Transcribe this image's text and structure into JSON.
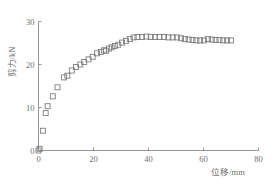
{
  "chart_data": {
    "type": "scatter",
    "title": "",
    "subtitle": "",
    "xlabel": "位移/mm",
    "ylabel": "剪力/kN",
    "xlim": [
      0,
      80
    ],
    "ylim": [
      0,
      30
    ],
    "xticks": [
      0,
      20,
      40,
      60,
      80
    ],
    "yticks": [
      0,
      10,
      20,
      30
    ],
    "xticklabels": [
      "0",
      "20",
      "40",
      "60",
      "80"
    ],
    "yticklabels": [
      "0",
      "10",
      "20",
      "30"
    ],
    "grid": false,
    "legend": null,
    "marker": "open-square",
    "marker_color": "#787878",
    "series": [
      {
        "name": "剪力-位移曲线",
        "x": [
          0.0,
          0.4,
          1.6,
          2.6,
          3.3,
          5.2,
          6.9,
          9.3,
          10.5,
          12.1,
          13.6,
          15.2,
          16.6,
          18.2,
          19.7,
          21.3,
          22.7,
          23.8,
          24.6,
          25.6,
          26.6,
          27.8,
          29.0,
          30.4,
          31.8,
          33.2,
          34.6,
          36.0,
          37.6,
          39.2,
          40.8,
          42.4,
          44.0,
          45.6,
          47.2,
          48.8,
          50.3,
          51.8,
          53.2,
          54.6,
          56.0,
          57.4,
          58.8,
          60.2,
          61.6,
          63.0,
          64.4,
          65.8,
          67.2,
          68.6,
          70.0
        ],
        "y": [
          0.0,
          0.4,
          4.6,
          8.7,
          10.3,
          12.6,
          14.7,
          17.0,
          17.4,
          18.6,
          19.4,
          20.0,
          20.6,
          21.2,
          21.8,
          22.6,
          22.9,
          23.3,
          23.2,
          23.7,
          24.0,
          24.3,
          24.6,
          25.1,
          25.5,
          25.9,
          26.3,
          26.4,
          26.4,
          26.5,
          26.4,
          26.4,
          26.4,
          26.4,
          26.3,
          26.3,
          26.3,
          26.1,
          25.9,
          25.8,
          25.7,
          25.6,
          25.6,
          25.6,
          25.9,
          25.8,
          25.7,
          25.7,
          25.6,
          25.6,
          25.6
        ]
      }
    ]
  }
}
